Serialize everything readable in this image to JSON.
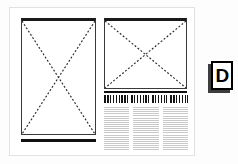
{
  "document": {
    "title": "Page layout wireframe",
    "type": "print-page-thumbnail"
  },
  "panel": {
    "name": "page",
    "background_color": "#ffffff",
    "border_color": "#e2e2e2"
  },
  "elements": {
    "left_image": {
      "label": "image-placeholder",
      "orientation": "portrait",
      "marker": "x-cross"
    },
    "right_image": {
      "label": "image-placeholder",
      "orientation": "landscape",
      "marker": "x-cross"
    },
    "headline": {
      "label": "headline",
      "style": "greeked-bold",
      "words": [
        {
          "id": "w1"
        },
        {
          "id": "w2"
        },
        {
          "id": "w3"
        },
        {
          "id": "w4"
        }
      ]
    },
    "body_text": {
      "label": "body-text",
      "style": "greeked",
      "columns": [
        {
          "id": "col-1"
        },
        {
          "id": "col-2"
        },
        {
          "id": "col-3"
        }
      ]
    }
  },
  "marker": {
    "letter": "D",
    "text_color": "#000000",
    "border_color": "#000000",
    "shadow_color": "#3d3d3d",
    "background_color": "#ffffff"
  }
}
